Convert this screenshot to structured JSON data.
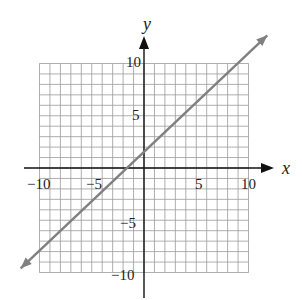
{
  "chart_data": {
    "type": "line",
    "title": "",
    "xlabel": "x",
    "ylabel": "y",
    "xlim": [
      -10,
      10
    ],
    "ylim": [
      -10,
      10
    ],
    "grid": true,
    "grid_step": 1,
    "x_ticks": [
      -10,
      -5,
      5,
      10
    ],
    "y_ticks": [
      10,
      5,
      -5,
      -10
    ],
    "x_tick_labels": [
      "−10",
      "−5",
      "5",
      "10"
    ],
    "y_tick_labels": [
      "10",
      "5",
      "−5",
      "−10"
    ],
    "series": [
      {
        "name": "line",
        "equation": "y = x + 3 (approx.)",
        "x": [
          -11.8,
          11.8
        ],
        "y": [
          -9.6,
          12.7
        ],
        "arrows_both_ends": true,
        "color": "#808080"
      }
    ],
    "legend": null
  },
  "labels": {
    "x_axis": "x",
    "y_axis": "y",
    "x_ticks": [
      "−10",
      "−5",
      "5",
      "10"
    ],
    "y_ticks": [
      "10",
      "5",
      "−5",
      "−10"
    ]
  },
  "colors": {
    "grid": "#9a9a9a",
    "axis": "#111111",
    "line": "#808080"
  }
}
